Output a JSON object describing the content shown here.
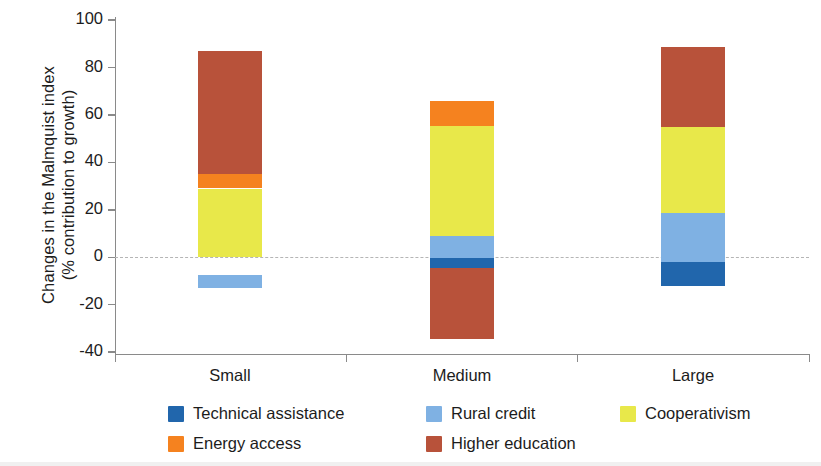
{
  "axis": {
    "y_title_line1": "Changes in the Malmquist index",
    "y_title_line2": "(% contribution to growth)",
    "y_ticks": [
      "100",
      "80",
      "60",
      "40",
      "20",
      "0",
      "-20",
      "-40"
    ],
    "x_ticks": [
      "Small",
      "Medium",
      "Large"
    ]
  },
  "legend": {
    "items": [
      {
        "label": "Technical assistance",
        "color": "#2166ac"
      },
      {
        "label": "Rural credit",
        "color": "#7fb1e3"
      },
      {
        "label": "Cooperativism",
        "color": "#e8e84a"
      },
      {
        "label": "Energy access",
        "color": "#f5821f"
      },
      {
        "label": "Higher education",
        "color": "#b8523a"
      }
    ]
  },
  "chart_data": {
    "type": "bar",
    "stacked": true,
    "title": "",
    "xlabel": "",
    "ylabel": "Changes in the Malmquist index (% contribution to growth)",
    "ylim": [
      -40,
      100
    ],
    "yticks": [
      -40,
      -20,
      0,
      20,
      40,
      60,
      80,
      100
    ],
    "grid": false,
    "zero_reference_line": true,
    "legend_position": "bottom",
    "categories": [
      "Small",
      "Medium",
      "Large"
    ],
    "series": [
      {
        "name": "Technical assistance",
        "color": "#2166ac",
        "values": [
          -5.5,
          -4.0,
          -10.0
        ]
      },
      {
        "name": "Rural credit",
        "color": "#7fb1e3",
        "values": [
          -7.5,
          9.5,
          20.5
        ]
      },
      {
        "name": "Cooperativism",
        "color": "#e8e84a",
        "values": [
          29.0,
          46.5,
          36.5
        ]
      },
      {
        "name": "Energy access",
        "color": "#f5821f",
        "values": [
          6.0,
          10.5,
          0.0
        ]
      },
      {
        "name": "Higher education",
        "color": "#b8523a",
        "values": [
          52.0,
          -30.0,
          33.5
        ]
      }
    ],
    "segments": {
      "Small": [
        {
          "name": "Technical assistance",
          "color": "#2166ac",
          "from": -7.5,
          "to": -13.0
        },
        {
          "name": "Rural credit",
          "color": "#7fb1e3",
          "from": -13.0,
          "to": -7.5
        },
        {
          "name": "Cooperativism",
          "color": "#e8e84a",
          "from": 0.0,
          "to": 29.0
        },
        {
          "name": "Energy access",
          "color": "#f5821f",
          "from": 29.0,
          "to": 35.0
        },
        {
          "name": "Higher education",
          "color": "#b8523a",
          "from": 35.0,
          "to": 87.0
        }
      ],
      "Medium": [
        {
          "name": "Higher education",
          "color": "#b8523a",
          "from": -34.5,
          "to": -4.5
        },
        {
          "name": "Technical assistance",
          "color": "#2166ac",
          "from": -4.5,
          "to": -0.5
        },
        {
          "name": "Rural credit",
          "color": "#7fb1e3",
          "from": -0.5,
          "to": 9.0
        },
        {
          "name": "Cooperativism",
          "color": "#e8e84a",
          "from": 9.0,
          "to": 55.5
        },
        {
          "name": "Energy access",
          "color": "#f5821f",
          "from": 55.5,
          "to": 66.0
        }
      ],
      "Large": [
        {
          "name": "Technical assistance",
          "color": "#2166ac",
          "from": -12.0,
          "to": -2.0
        },
        {
          "name": "Rural credit",
          "color": "#7fb1e3",
          "from": -2.0,
          "to": 18.5
        },
        {
          "name": "Cooperativism",
          "color": "#e8e84a",
          "from": 18.5,
          "to": 55.0
        },
        {
          "name": "Higher education",
          "color": "#b8523a",
          "from": 55.0,
          "to": 88.5
        }
      ]
    },
    "totals": {
      "Small": 87.0,
      "Medium": 66.0,
      "Large": 88.5
    }
  }
}
